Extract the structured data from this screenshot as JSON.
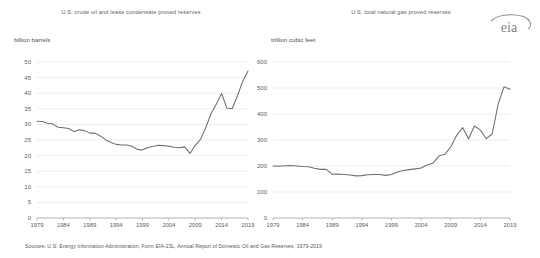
{
  "footnote": "Sources: U.S. Energy Information Administration, Form EIA-23L, Annual Report of Domestic Oil and Gas Reserves, 1979-2019",
  "logo": {
    "text": "eia",
    "name": "eia-logo",
    "color": "#808285"
  },
  "style": {
    "gridline_color": "#e9e9ea",
    "axis_color": "#a7a9ac",
    "series_color": "#6d6e71",
    "text_color": "#58595b"
  },
  "chart_data": [
    {
      "type": "line",
      "id": "crude-oil",
      "title": "U.S. crude oil and lease condensate proved reserves",
      "ylabel": "billion barrels",
      "xlabel": "",
      "grid": true,
      "legend": "none",
      "ylim": [
        0,
        50
      ],
      "yticks": [
        0,
        5,
        10,
        15,
        20,
        25,
        30,
        35,
        40,
        45,
        50
      ],
      "xlim": [
        1979,
        2019
      ],
      "xticks": [
        1979,
        1984,
        1989,
        1994,
        1999,
        2004,
        2009,
        2014,
        2019
      ],
      "x": [
        1979,
        1980,
        1981,
        1982,
        1983,
        1984,
        1985,
        1986,
        1987,
        1988,
        1989,
        1990,
        1991,
        1992,
        1993,
        1994,
        1995,
        1996,
        1997,
        1998,
        1999,
        2000,
        2001,
        2002,
        2003,
        2004,
        2005,
        2006,
        2007,
        2008,
        2009,
        2010,
        2011,
        2012,
        2013,
        2014,
        2015,
        2016,
        2017,
        2018,
        2019
      ],
      "values": [
        31.0,
        30.9,
        30.4,
        30.1,
        29.1,
        28.9,
        28.7,
        27.7,
        28.3,
        28.0,
        27.2,
        27.2,
        26.3,
        25.1,
        24.2,
        23.6,
        23.4,
        23.4,
        23.0,
        22.0,
        21.8,
        22.6,
        22.9,
        23.3,
        23.2,
        23.0,
        22.7,
        22.5,
        22.8,
        20.7,
        23.3,
        25.2,
        29.0,
        33.4,
        36.5,
        39.9,
        35.2,
        35.0,
        39.2,
        43.8,
        47.1
      ]
    },
    {
      "type": "line",
      "id": "natural-gas",
      "title": "U.S. total natural gas proved reserves",
      "ylabel": "trillion cubic feet",
      "xlabel": "",
      "grid": true,
      "legend": "none",
      "ylim": [
        0,
        600
      ],
      "yticks": [
        0,
        100,
        200,
        300,
        400,
        500,
        600
      ],
      "xlim": [
        1979,
        2019
      ],
      "xticks": [
        1979,
        1984,
        1989,
        1994,
        1999,
        2004,
        2009,
        2014,
        2019
      ],
      "x": [
        1979,
        1980,
        1981,
        1982,
        1983,
        1984,
        1985,
        1986,
        1987,
        1988,
        1989,
        1990,
        1991,
        1992,
        1993,
        1994,
        1995,
        1996,
        1997,
        1998,
        1999,
        2000,
        2001,
        2002,
        2003,
        2004,
        2005,
        2006,
        2007,
        2008,
        2009,
        2010,
        2011,
        2012,
        2013,
        2014,
        2015,
        2016,
        2017,
        2018,
        2019
      ],
      "values": [
        200,
        199,
        201,
        202,
        200,
        198,
        197,
        191,
        187,
        187,
        168,
        169,
        167,
        165,
        162,
        163,
        166,
        167,
        167,
        164,
        167,
        177,
        183,
        186,
        189,
        192,
        204,
        211,
        238,
        245,
        273,
        318,
        348,
        305,
        354,
        338,
        305,
        324,
        438,
        505,
        495
      ]
    }
  ]
}
